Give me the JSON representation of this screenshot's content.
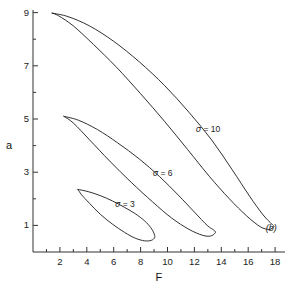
{
  "chart_data": {
    "type": "line",
    "title": "",
    "panel_label": "(b)",
    "xlabel": "F",
    "ylabel": "a",
    "xlim": [
      0,
      19.2
    ],
    "ylim": [
      0,
      9.5
    ],
    "grid": false,
    "legend_position": "inline-annotations",
    "xticks_major": [
      2,
      4,
      6,
      8,
      10,
      12,
      14,
      16,
      18
    ],
    "xticks_minor": [
      1,
      3,
      5,
      7,
      9,
      11,
      13,
      15,
      17
    ],
    "yticks_major": [
      1,
      3,
      5,
      7,
      9
    ],
    "yticks_minor": [
      2,
      4,
      6,
      8
    ],
    "xtick_labels": [
      "2",
      "4",
      "6",
      "8",
      "10",
      "12",
      "14",
      "16",
      "18"
    ],
    "ytick_labels": [
      "1",
      "3",
      "5",
      "7",
      "9"
    ],
    "annotations": [
      {
        "text": "σ = 10",
        "x": 12.1,
        "y": 4.6
      },
      {
        "text": "σ = 6",
        "x": 8.9,
        "y": 2.95
      },
      {
        "text": "σ = 3",
        "x": 6.1,
        "y": 1.75
      },
      {
        "text": "(b)",
        "x": 17.3,
        "y": 0.85
      }
    ],
    "series": [
      {
        "name": "σ = 3",
        "label": "σ = 3",
        "closed_loop": true,
        "color": "#1a1a1a",
        "cusp": {
          "x": 3.35,
          "y": 2.35
        },
        "tip": {
          "x": 9.05,
          "y": 0.55
        },
        "upper_branch": [
          [
            3.35,
            2.35
          ],
          [
            4.1,
            2.27
          ],
          [
            5.0,
            2.12
          ],
          [
            5.9,
            1.92
          ],
          [
            6.8,
            1.68
          ],
          [
            7.6,
            1.44
          ],
          [
            8.3,
            1.17
          ],
          [
            8.75,
            0.92
          ],
          [
            8.98,
            0.72
          ],
          [
            9.05,
            0.55
          ]
        ],
        "lower_branch": [
          [
            9.05,
            0.55
          ],
          [
            8.8,
            0.44
          ],
          [
            8.3,
            0.42
          ],
          [
            7.6,
            0.52
          ],
          [
            6.8,
            0.74
          ],
          [
            5.9,
            1.05
          ],
          [
            5.0,
            1.42
          ],
          [
            4.2,
            1.83
          ],
          [
            3.6,
            2.16
          ],
          [
            3.35,
            2.35
          ]
        ]
      },
      {
        "name": "σ = 6",
        "label": "σ = 6",
        "closed_loop": true,
        "color": "#1a1a1a",
        "cusp": {
          "x": 2.3,
          "y": 5.1
        },
        "tip": {
          "x": 13.55,
          "y": 0.72
        },
        "upper_branch": [
          [
            2.3,
            5.1
          ],
          [
            3.4,
            4.95
          ],
          [
            4.8,
            4.6
          ],
          [
            6.3,
            4.1
          ],
          [
            7.9,
            3.5
          ],
          [
            9.4,
            2.84
          ],
          [
            10.8,
            2.14
          ],
          [
            12.0,
            1.5
          ],
          [
            12.95,
            1.0
          ],
          [
            13.45,
            0.82
          ],
          [
            13.55,
            0.72
          ]
        ],
        "lower_branch": [
          [
            13.55,
            0.72
          ],
          [
            13.2,
            0.6
          ],
          [
            12.6,
            0.63
          ],
          [
            11.6,
            0.85
          ],
          [
            10.3,
            1.28
          ],
          [
            8.9,
            1.88
          ],
          [
            7.3,
            2.62
          ],
          [
            5.7,
            3.42
          ],
          [
            4.2,
            4.22
          ],
          [
            3.0,
            4.85
          ],
          [
            2.3,
            5.1
          ]
        ]
      },
      {
        "name": "σ = 10",
        "label": "σ = 10",
        "closed_loop": true,
        "color": "#1a1a1a",
        "cusp": {
          "x": 1.42,
          "y": 8.98
        },
        "tip": {
          "x": 17.9,
          "y": 0.95
        },
        "upper_branch": [
          [
            1.42,
            8.98
          ],
          [
            2.6,
            8.85
          ],
          [
            4.2,
            8.5
          ],
          [
            6.0,
            7.92
          ],
          [
            7.9,
            7.15
          ],
          [
            9.8,
            6.25
          ],
          [
            11.6,
            5.25
          ],
          [
            13.3,
            4.2
          ],
          [
            14.8,
            3.1
          ],
          [
            16.1,
            2.1
          ],
          [
            17.1,
            1.4
          ],
          [
            17.75,
            1.05
          ],
          [
            17.9,
            0.95
          ]
        ],
        "lower_branch": [
          [
            17.9,
            0.95
          ],
          [
            17.55,
            0.85
          ],
          [
            16.9,
            0.95
          ],
          [
            15.9,
            1.35
          ],
          [
            14.6,
            2.0
          ],
          [
            13.1,
            2.85
          ],
          [
            11.5,
            3.85
          ],
          [
            9.8,
            4.9
          ],
          [
            8.0,
            5.95
          ],
          [
            6.2,
            6.95
          ],
          [
            4.5,
            7.8
          ],
          [
            3.0,
            8.5
          ],
          [
            1.9,
            8.88
          ],
          [
            1.42,
            8.98
          ]
        ]
      }
    ]
  }
}
